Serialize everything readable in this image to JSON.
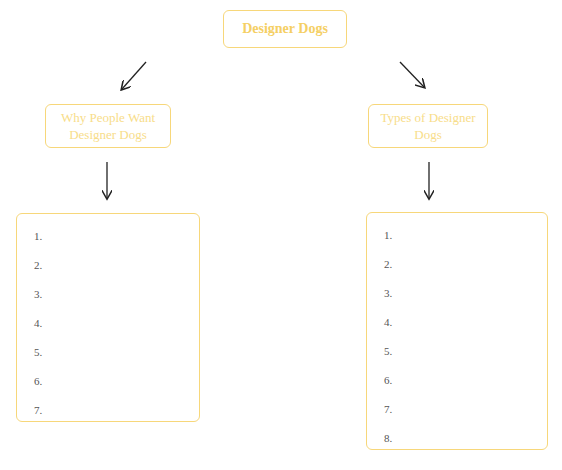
{
  "root": {
    "label": "Designer Dogs"
  },
  "branches": [
    {
      "heading": "Why People Want Designer Dogs",
      "items": [
        "1.",
        "2.",
        "3.",
        "4.",
        "5.",
        "6.",
        "7."
      ]
    },
    {
      "heading": "Types of Designer Dogs",
      "items": [
        "1.",
        "2.",
        "3.",
        "4.",
        "5.",
        "6.",
        "7.",
        "8."
      ]
    }
  ],
  "colors": {
    "accent": "#f5cf64",
    "border": "#f7d77a",
    "arrow": "#222222",
    "text": "#555555"
  }
}
